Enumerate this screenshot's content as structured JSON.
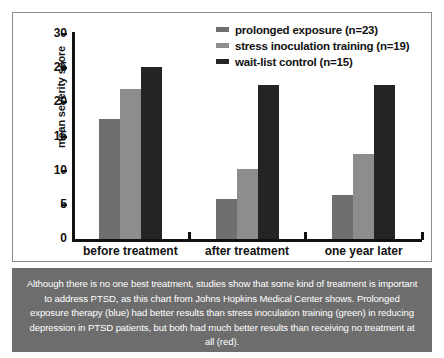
{
  "chart_data": {
    "type": "bar",
    "title": "",
    "subtitle": "",
    "xlabel": "",
    "ylabel": "mean severity score",
    "ylim": [
      0,
      30
    ],
    "yticks": [
      0,
      5,
      10,
      15,
      20,
      25,
      30
    ],
    "ytick_labels": [
      "0",
      "5",
      "10",
      "15",
      "20",
      "25",
      "30"
    ],
    "grid": false,
    "legend_position": "top-right",
    "categories": [
      "before treatment",
      "after treatment",
      "one year later"
    ],
    "series": [
      {
        "name": "prolonged exposure (n=23)",
        "short_name": "prolonged exposure",
        "n": 23,
        "color": "#6f6f6f",
        "values": [
          17.6,
          5.8,
          6.4
        ]
      },
      {
        "name": "stress inoculation training (n=19)",
        "short_name": "stress inoculation training",
        "n": 19,
        "color": "#8d8d8d",
        "values": [
          21.9,
          10.2,
          12.5
        ]
      },
      {
        "name": "wait-list control (n=15)",
        "short_name": "wait-list control",
        "n": 15,
        "color": "#242424",
        "values": [
          25.2,
          22.5,
          22.6
        ]
      }
    ]
  },
  "legend": {
    "items": [
      {
        "label": "prolonged exposure (n=23)",
        "color": "#6f6f6f"
      },
      {
        "label": "stress inoculation training (n=19)",
        "color": "#8d8d8d"
      },
      {
        "label": "wait-list control (n=15)",
        "color": "#242424"
      }
    ]
  },
  "caption": {
    "text": "Although there is no one best treatment, studies show that some kind of treatment is important to address PTSD, as this chart from Johns Hopkins Medical Center shows. Prolonged exposure therapy (blue) had better results than stress inoculation training (green) in reducing depression in PTSD patients, but both had much better results than receiving no treatment at all (red).",
    "background": "#6d6d6d",
    "text_color": "#ffffff"
  },
  "colors": {
    "panel_border": "#8d8d8d",
    "axis": "#111111",
    "page_background": "#ffffff"
  }
}
